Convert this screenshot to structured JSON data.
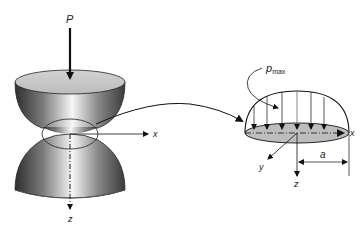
{
  "figure": {
    "left": {
      "load_label": "P",
      "x_axis_label": "x",
      "z_axis_label": "z"
    },
    "right": {
      "pressure_label_main": "p",
      "pressure_label_sub": "max",
      "x_axis_label": "x",
      "y_axis_label": "y",
      "z_axis_label": "z",
      "dimension_label": "a"
    },
    "colors": {
      "line": "#111111",
      "contact_fill": "#bdbdbd",
      "sphere_dark": "#3a3a3a",
      "sphere_light": "#f4f4f4",
      "top_face": "#c8c8c8"
    }
  }
}
